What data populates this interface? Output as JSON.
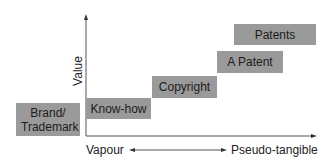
{
  "diagram": {
    "y_axis_label": "Value",
    "x_axis_left_label": "Vapour",
    "x_axis_right_label": "Pseudo-tangible",
    "box_color": "#9a9a9a",
    "boxes": [
      {
        "label": "Brand/ Trademark"
      },
      {
        "label": "Know-how"
      },
      {
        "label": "Copyright"
      },
      {
        "label": "A Patent"
      },
      {
        "label": "Patents"
      }
    ]
  }
}
